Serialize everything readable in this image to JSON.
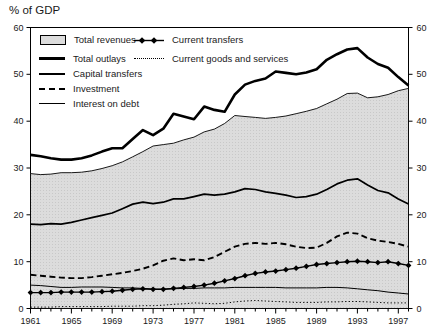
{
  "title": "% of GDP",
  "legend": {
    "items": [
      {
        "label": "Total revenues",
        "marker": "area-swatch"
      },
      {
        "label": "Total outlays",
        "marker": "thick-line"
      },
      {
        "label": "Capital transfers",
        "marker": "medium-line"
      },
      {
        "label": "Investment",
        "marker": "dashed-line"
      },
      {
        "label": "Interest on debt",
        "marker": "thin-line"
      },
      {
        "label": "Current transfers",
        "marker": "diamond-line"
      },
      {
        "label": "Current goods and services",
        "marker": "dotted-line"
      }
    ]
  },
  "colors": {
    "line": "#000000",
    "area_fill": "#dcdcdc",
    "area_dot": "#c8c8c8",
    "background": "#ffffff",
    "text": "#1a1a1a"
  },
  "chart_data": {
    "type": "line",
    "title": "% of GDP",
    "xlabel": "",
    "ylabel": "% of GDP",
    "xlim": [
      1961,
      1998
    ],
    "ylim": [
      0,
      60
    ],
    "grid": false,
    "legend_position": "top-left",
    "xticks": [
      1961,
      1965,
      1969,
      1973,
      1977,
      1981,
      1985,
      1989,
      1993,
      1997
    ],
    "yticks": [
      0,
      10,
      20,
      30,
      40,
      50,
      60
    ],
    "x": [
      1961,
      1962,
      1963,
      1964,
      1965,
      1966,
      1967,
      1968,
      1969,
      1970,
      1971,
      1972,
      1973,
      1974,
      1975,
      1976,
      1977,
      1978,
      1979,
      1980,
      1981,
      1982,
      1983,
      1984,
      1985,
      1986,
      1987,
      1988,
      1989,
      1990,
      1991,
      1992,
      1993,
      1994,
      1995,
      1996,
      1997,
      1998
    ],
    "series": [
      {
        "name": "Total revenues",
        "style": "area",
        "values": [
          28.8,
          28.6,
          28.7,
          29.0,
          29.0,
          29.1,
          29.4,
          29.9,
          30.5,
          31.3,
          32.4,
          33.5,
          34.7,
          35.0,
          35.3,
          36.0,
          36.6,
          37.7,
          38.3,
          39.5,
          41.2,
          41.0,
          40.8,
          40.6,
          40.8,
          41.1,
          41.6,
          42.1,
          42.7,
          43.7,
          44.7,
          45.9,
          46.0,
          45.0,
          45.2,
          45.7,
          46.5,
          47.0
        ]
      },
      {
        "name": "Total outlays",
        "style": "thick",
        "values": [
          32.8,
          32.5,
          32.1,
          31.8,
          31.8,
          32.1,
          32.7,
          33.5,
          34.2,
          34.2,
          36.2,
          38.1,
          37.0,
          38.4,
          41.6,
          41.0,
          40.4,
          43.1,
          42.4,
          42.0,
          45.7,
          47.8,
          48.6,
          49.1,
          50.6,
          50.3,
          50.0,
          50.4,
          51.1,
          53.1,
          54.3,
          55.3,
          55.6,
          53.6,
          52.2,
          51.4,
          49.4,
          47.6
        ]
      },
      {
        "name": "Capital transfers",
        "style": "medium",
        "values": [
          18.0,
          17.9,
          18.1,
          18.0,
          18.4,
          18.9,
          19.4,
          19.9,
          20.4,
          21.3,
          22.3,
          22.7,
          22.4,
          22.7,
          23.4,
          23.4,
          23.9,
          24.4,
          24.2,
          24.4,
          24.9,
          25.6,
          25.4,
          24.9,
          24.6,
          24.2,
          23.7,
          23.9,
          24.4,
          25.4,
          26.6,
          27.4,
          27.7,
          26.4,
          25.2,
          24.7,
          23.4,
          22.3
        ]
      },
      {
        "name": "Investment",
        "style": "dashed",
        "values": [
          7.2,
          7.0,
          6.8,
          6.6,
          6.5,
          6.5,
          6.7,
          7.0,
          7.3,
          7.6,
          8.0,
          8.5,
          9.2,
          10.2,
          10.7,
          10.3,
          10.5,
          10.3,
          11.0,
          12.1,
          13.2,
          13.8,
          14.0,
          13.8,
          14.0,
          13.7,
          13.2,
          12.9,
          13.0,
          14.0,
          15.4,
          16.2,
          16.0,
          15.0,
          14.5,
          14.2,
          13.8,
          13.2
        ]
      },
      {
        "name": "Current goods and services",
        "style": "dotted",
        "values": [
          0.3,
          0.3,
          0.3,
          0.4,
          0.4,
          0.4,
          0.4,
          0.4,
          0.5,
          0.5,
          0.5,
          0.6,
          0.6,
          0.7,
          0.9,
          1.0,
          1.2,
          1.1,
          1.0,
          1.1,
          1.4,
          1.6,
          1.7,
          1.6,
          1.5,
          1.4,
          1.3,
          1.3,
          1.3,
          1.4,
          1.4,
          1.5,
          1.5,
          1.4,
          1.3,
          1.2,
          1.2,
          1.2
        ]
      },
      {
        "name": "Interest on debt",
        "style": "thin",
        "values": [
          5.0,
          4.9,
          4.7,
          4.5,
          4.5,
          4.6,
          4.6,
          4.6,
          4.5,
          4.4,
          4.4,
          4.3,
          4.1,
          4.1,
          4.2,
          4.3,
          4.3,
          4.4,
          4.4,
          4.4,
          4.5,
          4.5,
          4.5,
          4.5,
          4.5,
          4.4,
          4.4,
          4.4,
          4.4,
          4.5,
          4.5,
          4.4,
          4.2,
          4.0,
          3.8,
          3.5,
          3.3,
          3.1
        ]
      },
      {
        "name": "Current transfers",
        "style": "diamond",
        "values": [
          3.4,
          3.4,
          3.4,
          3.5,
          3.5,
          3.5,
          3.5,
          3.6,
          3.7,
          3.9,
          4.1,
          4.2,
          4.1,
          4.1,
          4.3,
          4.5,
          4.7,
          5.0,
          5.4,
          5.9,
          6.4,
          7.0,
          7.5,
          7.8,
          8.0,
          8.3,
          8.6,
          9.0,
          9.4,
          9.6,
          9.8,
          10.0,
          10.1,
          10.0,
          9.8,
          10.0,
          9.6,
          9.2
        ]
      }
    ]
  }
}
